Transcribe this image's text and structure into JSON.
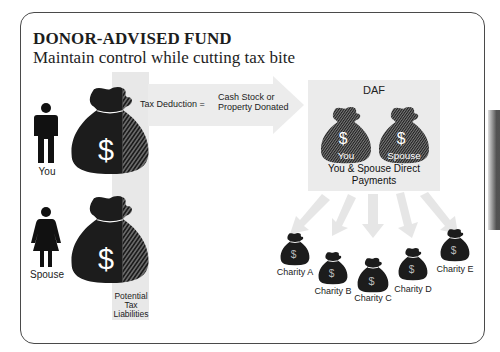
{
  "header": {
    "title": "DONOR-ADVISED FUND",
    "subtitle": "Maintain control while cutting tax bite"
  },
  "donors": [
    {
      "label": "You",
      "icon": "man-icon"
    },
    {
      "label": "Spouse",
      "icon": "woman-icon"
    }
  ],
  "arrow": {
    "left_text": "Tax Deduction =",
    "right_line1": "Cash Stock or",
    "right_line2": "Property Donated"
  },
  "tax_column": {
    "label_line1": "Potential",
    "label_line2": "Tax",
    "label_line3": "Liabilities"
  },
  "daf": {
    "title": "DAF",
    "bags": [
      {
        "label": "You",
        "symbol": "$"
      },
      {
        "label": "Spouse",
        "symbol": "$"
      }
    ],
    "caption_line1": "You & Spouse Direct",
    "caption_line2": "Payments"
  },
  "charities": [
    {
      "label": "Charity A",
      "symbol": "$"
    },
    {
      "label": "Charity B",
      "symbol": "$"
    },
    {
      "label": "Charity C",
      "symbol": "$"
    },
    {
      "label": "Charity D",
      "symbol": "$"
    },
    {
      "label": "Charity E",
      "symbol": "$"
    }
  ],
  "colors": {
    "bag": "#1c1c1c",
    "panel_gray": "#e8e8e8",
    "arrow_gray": "#ececec",
    "border": "#4a4a4a"
  },
  "symbols": {
    "dollar": "$"
  }
}
